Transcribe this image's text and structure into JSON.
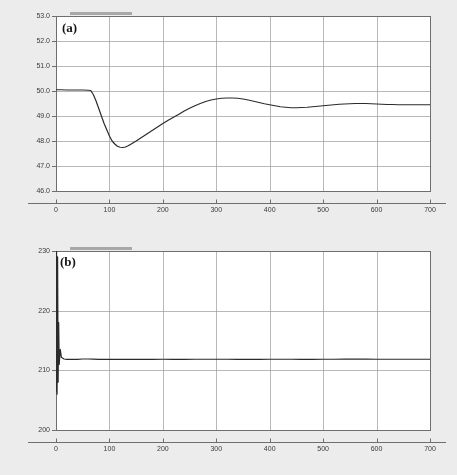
{
  "figure": {
    "background_color": "#ececed",
    "plot_background_color": "#ffffff",
    "grid_color": "#9a9a9a",
    "axis_color": "#6e6e6e",
    "curve_color": "#2b2b2b",
    "text_color": "#3a3a3a",
    "panels": [
      {
        "label": "(a)"
      },
      {
        "label": "(b)"
      }
    ]
  },
  "chart_data": [
    {
      "type": "line",
      "title": "",
      "panel_label": "(a)",
      "xlabel": "",
      "ylabel": "",
      "xlim": [
        0,
        700
      ],
      "ylim": [
        46.0,
        53.0
      ],
      "xticks": [
        0,
        100,
        200,
        300,
        400,
        500,
        600,
        700
      ],
      "xtick_labels": [
        "0",
        "100",
        "200",
        "300",
        "400",
        "500",
        "600",
        "700"
      ],
      "yticks": [
        46.0,
        47.0,
        48.0,
        49.0,
        50.0,
        51.0,
        52.0,
        53.0
      ],
      "ytick_labels": [
        "46.0",
        "47.0",
        "48.0",
        "49.0",
        "50.0",
        "51.0",
        "52.0",
        "53.0"
      ],
      "grid": true,
      "legend": "none",
      "series": [
        {
          "name": "response-a",
          "x": [
            0,
            10,
            20,
            30,
            40,
            50,
            60,
            65,
            70,
            75,
            80,
            85,
            90,
            95,
            100,
            105,
            110,
            115,
            120,
            125,
            130,
            135,
            140,
            150,
            160,
            170,
            180,
            190,
            200,
            210,
            220,
            230,
            240,
            250,
            260,
            270,
            280,
            290,
            300,
            310,
            320,
            330,
            340,
            350,
            360,
            370,
            380,
            390,
            400,
            410,
            420,
            430,
            440,
            450,
            460,
            470,
            480,
            490,
            500,
            510,
            520,
            530,
            540,
            550,
            560,
            570,
            580,
            590,
            600,
            610,
            620,
            630,
            640,
            650,
            660,
            670,
            680,
            690,
            700
          ],
          "y": [
            50.05,
            50.05,
            50.04,
            50.04,
            50.04,
            50.04,
            50.03,
            50.02,
            49.85,
            49.6,
            49.3,
            49.0,
            48.7,
            48.45,
            48.2,
            48.0,
            47.88,
            47.79,
            47.75,
            47.74,
            47.76,
            47.81,
            47.87,
            48.0,
            48.14,
            48.28,
            48.42,
            48.56,
            48.7,
            48.83,
            48.95,
            49.07,
            49.2,
            49.31,
            49.41,
            49.5,
            49.58,
            49.64,
            49.68,
            49.71,
            49.72,
            49.72,
            49.71,
            49.68,
            49.64,
            49.59,
            49.54,
            49.49,
            49.45,
            49.41,
            49.37,
            49.35,
            49.33,
            49.33,
            49.34,
            49.35,
            49.37,
            49.39,
            49.41,
            49.43,
            49.45,
            49.47,
            49.48,
            49.49,
            49.5,
            49.5,
            49.5,
            49.49,
            49.48,
            49.47,
            49.46,
            49.46,
            49.45,
            49.45,
            49.45,
            49.45,
            49.45,
            49.45,
            49.45
          ]
        }
      ]
    },
    {
      "type": "line",
      "title": "",
      "panel_label": "(b)",
      "xlabel": "",
      "ylabel": "",
      "xlim": [
        0,
        700
      ],
      "ylim": [
        200,
        230
      ],
      "xticks": [
        0,
        100,
        200,
        300,
        400,
        500,
        600,
        700
      ],
      "xtick_labels": [
        "0",
        "100",
        "200",
        "300",
        "400",
        "500",
        "600",
        "700"
      ],
      "yticks": [
        200,
        210,
        220,
        230
      ],
      "ytick_labels": [
        "200",
        "210",
        "220",
        "230"
      ],
      "grid": true,
      "legend": "none",
      "series": [
        {
          "name": "response-b",
          "x": [
            0,
            1,
            2,
            3,
            4,
            5,
            6,
            8,
            10,
            15,
            20,
            30,
            40,
            50,
            60,
            70,
            80,
            90,
            100,
            120,
            140,
            160,
            180,
            200,
            220,
            240,
            260,
            280,
            300,
            320,
            340,
            360,
            380,
            400,
            420,
            440,
            460,
            480,
            500,
            520,
            540,
            560,
            580,
            600,
            620,
            640,
            660,
            680,
            700
          ],
          "y": [
            206.5,
            230.0,
            206.0,
            229.0,
            208.0,
            218.0,
            211.0,
            213.5,
            212.2,
            211.9,
            211.85,
            211.85,
            211.85,
            211.9,
            211.9,
            211.88,
            211.85,
            211.84,
            211.83,
            211.83,
            211.84,
            211.85,
            211.85,
            211.86,
            211.85,
            211.85,
            211.86,
            211.86,
            211.86,
            211.86,
            211.85,
            211.85,
            211.85,
            211.86,
            211.86,
            211.86,
            211.85,
            211.85,
            211.86,
            211.86,
            211.87,
            211.88,
            211.87,
            211.86,
            211.86,
            211.86,
            211.86,
            211.86,
            211.86
          ]
        }
      ]
    }
  ]
}
